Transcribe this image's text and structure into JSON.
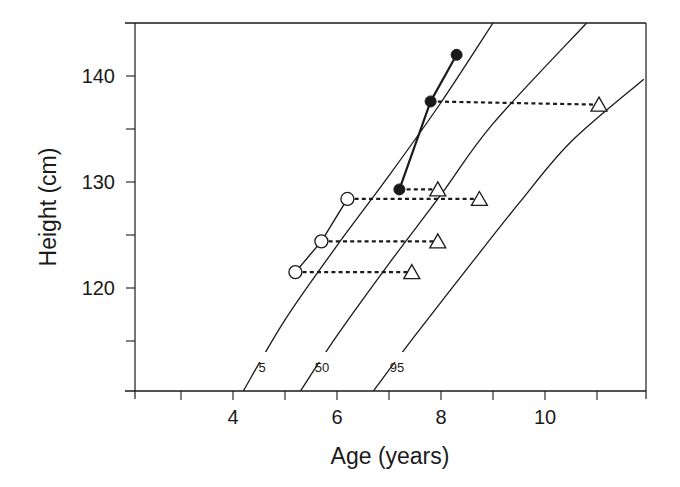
{
  "chart_data": {
    "type": "line",
    "title": "",
    "xlabel": "Age (years)",
    "ylabel": "Height (cm)",
    "xlim": [
      2.1,
      11.9
    ],
    "ylim": [
      110.3,
      145
    ],
    "grid": false,
    "legend": null,
    "x_ticks": [
      {
        "value": 3,
        "label": ""
      },
      {
        "value": 4,
        "label": "4"
      },
      {
        "value": 5,
        "label": ""
      },
      {
        "value": 6,
        "label": "6"
      },
      {
        "value": 7,
        "label": ""
      },
      {
        "value": 8,
        "label": "8"
      },
      {
        "value": 9,
        "label": ""
      },
      {
        "value": 10,
        "label": "10"
      },
      {
        "value": 11,
        "label": ""
      }
    ],
    "y_ticks": [
      {
        "value": 115,
        "label": ""
      },
      {
        "value": 120,
        "label": "120"
      },
      {
        "value": 125,
        "label": ""
      },
      {
        "value": 130,
        "label": "130"
      },
      {
        "value": 135,
        "label": ""
      },
      {
        "value": 140,
        "label": "140"
      }
    ],
    "percentile_curves": [
      {
        "name": "5",
        "label": "5",
        "points": [
          [
            4.2,
            110.3
          ],
          [
            5.0,
            117
          ],
          [
            6.0,
            124
          ],
          [
            7.0,
            130.6
          ],
          [
            8.0,
            137.5
          ],
          [
            9.0,
            145
          ]
        ]
      },
      {
        "name": "50",
        "label": "50",
        "points": [
          [
            5.3,
            110.3
          ],
          [
            6.0,
            115.5
          ],
          [
            7.0,
            122.3
          ],
          [
            8.0,
            128.8
          ],
          [
            9.0,
            135.5
          ],
          [
            10.8,
            145
          ]
        ]
      },
      {
        "name": "95",
        "label": "95",
        "points": [
          [
            6.7,
            110.3
          ],
          [
            7.5,
            115.5
          ],
          [
            8.5,
            121.8
          ],
          [
            9.5,
            128
          ],
          [
            10.5,
            133.8
          ],
          [
            11.9,
            139.7
          ]
        ]
      }
    ],
    "series": [
      {
        "name": "open-circles",
        "marker": "circle-open",
        "connected": true,
        "points": [
          [
            5.2,
            121.5
          ],
          [
            5.7,
            124.4
          ],
          [
            6.2,
            128.4
          ]
        ]
      },
      {
        "name": "filled-circles",
        "marker": "circle-filled",
        "connected": true,
        "points": [
          [
            7.2,
            129.3
          ],
          [
            7.8,
            137.6
          ],
          [
            8.3,
            142
          ]
        ]
      },
      {
        "name": "triangles",
        "marker": "triangle-open",
        "connected": false,
        "points": [
          [
            7.4,
            121.5
          ],
          [
            7.9,
            124.4
          ],
          [
            8.7,
            128.4
          ],
          [
            7.9,
            129.3
          ],
          [
            11.0,
            137.3
          ]
        ]
      }
    ],
    "links": [
      {
        "from": [
          5.2,
          121.5
        ],
        "to": [
          7.4,
          121.5
        ],
        "style": "dotted"
      },
      {
        "from": [
          5.7,
          124.4
        ],
        "to": [
          7.9,
          124.4
        ],
        "style": "dotted"
      },
      {
        "from": [
          6.2,
          128.4
        ],
        "to": [
          8.7,
          128.4
        ],
        "style": "dotted"
      },
      {
        "from": [
          7.2,
          129.3
        ],
        "to": [
          7.9,
          129.3
        ],
        "style": "dotted"
      },
      {
        "from": [
          7.8,
          137.6
        ],
        "to": [
          11.0,
          137.3
        ],
        "style": "dotted"
      }
    ]
  },
  "layout": {
    "plot": {
      "left": 135,
      "right": 646,
      "top": 23,
      "bottom": 391
    },
    "x_map": {
      "px_per_unit": 52,
      "x0_value": 4,
      "x0_px": 233
    },
    "y_map": {
      "px_per_unit": 10.6,
      "y0_value": 130,
      "y0_px": 182
    },
    "curve_label_positions": {
      "5": [
        262,
        372
      ],
      "50": [
        322,
        372
      ],
      "95": [
        397,
        372
      ]
    },
    "curve_gaps": {
      "5": [
        [
          258,
          362,
          272,
          352
        ]
      ],
      "50": [
        [
          315,
          362,
          330,
          352
        ]
      ],
      "95": [
        [
          388,
          362,
          406,
          352
        ]
      ]
    },
    "colors": {
      "ink": "#1a1a1a",
      "background": "#ffffff"
    }
  }
}
